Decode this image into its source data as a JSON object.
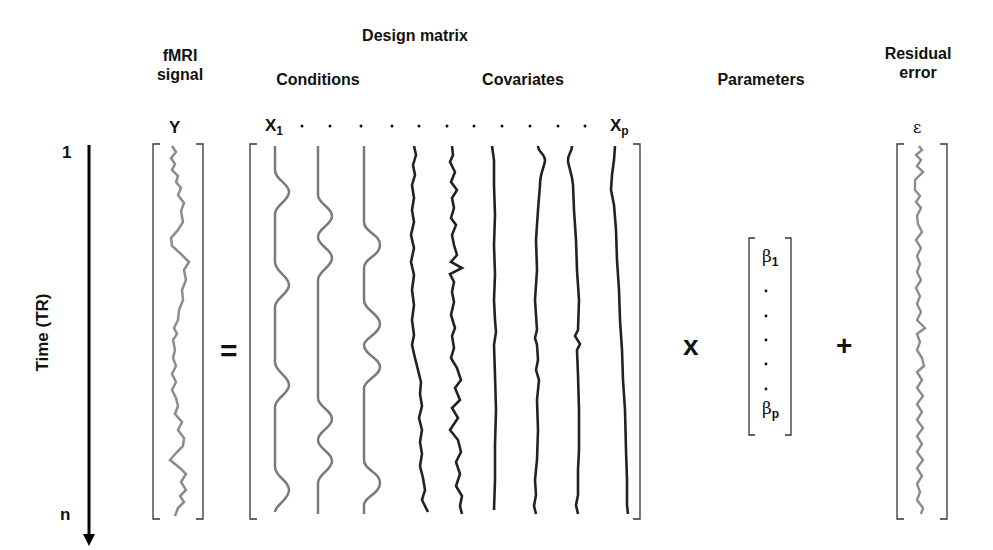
{
  "headers": {
    "signal": [
      "fMRI",
      "signal"
    ],
    "design_matrix": "Design matrix",
    "conditions": "Conditions",
    "covariates": "Covariates",
    "parameters": "Parameters",
    "residual": [
      "Residual",
      "error"
    ]
  },
  "symbols": {
    "Y": "Y",
    "X1_base": "X",
    "X1_sub": "1",
    "Xp_base": "X",
    "Xp_sub": "p",
    "epsilon": "ε",
    "beta1_base": "β",
    "beta1_sub": "1",
    "betap_base": "β",
    "betap_sub": "p",
    "equals": "=",
    "times": "x",
    "plus": "+"
  },
  "time_axis": {
    "label": "Time (TR)",
    "start": "1",
    "end": "n"
  },
  "design_matrix": {
    "condition_columns": 3,
    "covariate_columns": 7,
    "header_dots": 11
  },
  "parameter_vector": {
    "dots": 5
  },
  "colors": {
    "text": "#111111",
    "bracket": "#333333",
    "signal_curve": "#8c8c8c",
    "condition_curve": "#7a7a7a",
    "covariate_curve": "#222222"
  }
}
